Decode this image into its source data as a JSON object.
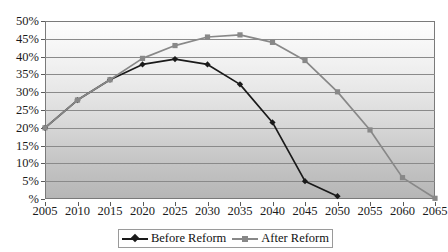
{
  "chart_data": {
    "type": "line",
    "title": "",
    "xlabel": "",
    "ylabel": "",
    "x": [
      2005,
      2010,
      2015,
      2020,
      2025,
      2030,
      2035,
      2040,
      2045,
      2050,
      2055,
      2060,
      2065
    ],
    "categories": [
      "2005",
      "2010",
      "2015",
      "2020",
      "2025",
      "2030",
      "2035",
      "2040",
      "2045",
      "2050",
      "2055",
      "2060",
      "2065"
    ],
    "series": [
      {
        "name": "Before Reform",
        "color": "#1a1a1a",
        "marker": "diamond",
        "values": [
          20.0,
          27.8,
          33.5,
          37.8,
          39.3,
          37.8,
          32.2,
          21.5,
          5.0,
          0.8,
          null,
          null,
          null
        ]
      },
      {
        "name": "After Reform",
        "color": "#888888",
        "marker": "square",
        "values": [
          20.0,
          27.8,
          33.5,
          39.5,
          43.1,
          45.5,
          46.1,
          44.0,
          38.9,
          30.1,
          19.4,
          6.0,
          0.2
        ]
      }
    ],
    "ylim": [
      0,
      50
    ],
    "xlim": [
      2005,
      2065
    ],
    "yticks": [
      0,
      5,
      10,
      15,
      20,
      25,
      30,
      35,
      40,
      45,
      50
    ],
    "ytick_labels": [
      "%",
      "5%",
      "10%",
      "15%",
      "20%",
      "25%",
      "30%",
      "35%",
      "40%",
      "45%",
      "50%"
    ],
    "grid": true,
    "legend_position": "bottom",
    "plot_background": "gradient-white-to-gray"
  },
  "legend": {
    "items": [
      {
        "label": "Before Reform",
        "color": "#1a1a1a",
        "marker": "diamond"
      },
      {
        "label": "After Reform",
        "color": "#888888",
        "marker": "square"
      }
    ]
  },
  "colors": {
    "before_reform": "#1a1a1a",
    "after_reform": "#888888",
    "gridline": "#8a8a8a",
    "axis": "#7a7a7a",
    "text": "#1a1a1a"
  }
}
